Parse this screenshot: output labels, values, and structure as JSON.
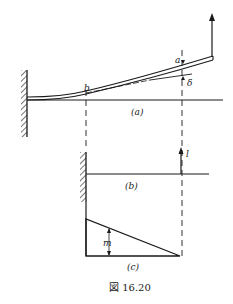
{
  "figure": {
    "caption": "図 16.20",
    "colors": {
      "ink": "#1a1a1a",
      "background": "#ffffff"
    },
    "panels": {
      "a": {
        "label": "(a)",
        "point_b": "b",
        "point_a": "a",
        "deflection": "δ",
        "description": "Cantilever beam fixed at left wall, deflected upward by a load applied at the free end"
      },
      "b": {
        "label": "(b)",
        "unit_load": "l",
        "description": "Cantilever beam with unit upward load applied at point a"
      },
      "c": {
        "label": "(c)",
        "moment": "m",
        "description": "Triangular bending moment diagram, maximum at the fixed end, zero at point a"
      }
    }
  }
}
